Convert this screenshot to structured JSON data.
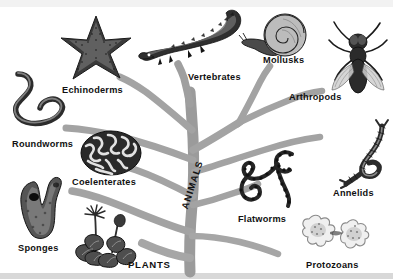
{
  "diagram": {
    "type": "phylogenetic-tree-illustration",
    "trunk_label": "ANIMALS",
    "root_label": "PLANTS",
    "tree_color": "#9b9b9b",
    "background_color": "#ffffff",
    "text_color": "#111111"
  },
  "labels": {
    "echinoderms": "Echinoderms",
    "vertebrates": "Vertebrates",
    "mollusks": "Mollusks",
    "arthropods": "Arthropods",
    "roundworms": "Roundworms",
    "coelenterates": "Coelenterates",
    "annelids": "Annelids",
    "flatworms": "Flatworms",
    "sponges": "Sponges",
    "plants": "PLANTS",
    "protozoans": "Protozoans",
    "animals": "ANIMALS"
  },
  "organisms": [
    {
      "key": "echinoderms",
      "label": "Echinoderms",
      "icon": "starfish-illustration",
      "x": 58,
      "y": 14
    },
    {
      "key": "vertebrates",
      "label": "Vertebrates",
      "icon": "alligator-illustration",
      "x": 138,
      "y": 6
    },
    {
      "key": "mollusks",
      "label": "Mollusks",
      "icon": "snail-illustration",
      "x": 241,
      "y": 13
    },
    {
      "key": "arthropods",
      "label": "Arthropods",
      "icon": "fly-illustration",
      "x": 326,
      "y": 20
    },
    {
      "key": "roundworms",
      "label": "Roundworms",
      "icon": "roundworm-illustration",
      "x": 8,
      "y": 70
    },
    {
      "key": "coelenterates",
      "label": "Coelenterates",
      "icon": "brain-coral-illustration",
      "x": 80,
      "y": 130
    },
    {
      "key": "annelids",
      "label": "Annelids",
      "icon": "segmented-worm-illustration",
      "x": 336,
      "y": 122
    },
    {
      "key": "flatworms",
      "label": "Flatworms",
      "icon": "flatworm-illustration",
      "x": 232,
      "y": 148
    },
    {
      "key": "sponges",
      "label": "Sponges",
      "icon": "sponge-illustration",
      "x": 12,
      "y": 175
    },
    {
      "key": "plants",
      "label": "PLANTS",
      "icon": "flowering-plant-illustration",
      "x": 70,
      "y": 205
    },
    {
      "key": "protozoans",
      "label": "Protozoans",
      "icon": "amoeba-illustration",
      "x": 297,
      "y": 210
    }
  ]
}
